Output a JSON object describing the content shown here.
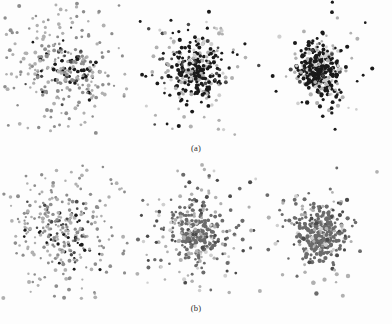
{
  "figure": {
    "background": "#fdfdfd",
    "rows": [
      {
        "id": "a",
        "caption": "(a)"
      },
      {
        "id": "b",
        "caption": "(b)"
      }
    ]
  },
  "colors": {
    "dark": "#1a1a1a",
    "mid_dark": "#4a4a4a",
    "mid": "#6b6b6b",
    "mid_light": "#8d8d8d",
    "light": "#b0b0b0",
    "pale": "#cfcfcf",
    "background": "#fdfdfd"
  },
  "chart_data": {
    "type": "scatter",
    "title": "",
    "xlabel": "",
    "ylabel": "",
    "grid": false,
    "legend": null,
    "axes_visible": false,
    "panel_layout": {
      "rows": 2,
      "cols": 3
    },
    "panels": [
      {
        "row": "a",
        "col": 1,
        "name": "panel-a-1",
        "center": [
          65,
          70
        ],
        "n_points": 330,
        "spread_x": 30,
        "spread_y": 33,
        "core_concentration": 0.3,
        "dot_radius": [
          1.1,
          2.0
        ],
        "color_mix": [
          {
            "color": "#1a1a1a",
            "weight": 0.34
          },
          {
            "color": "#4a4a4a",
            "weight": 0.2
          },
          {
            "color": "#8d8d8d",
            "weight": 0.24
          },
          {
            "color": "#b0b0b0",
            "weight": 0.22
          }
        ],
        "seed": 11
      },
      {
        "row": "a",
        "col": 2,
        "name": "panel-a-2",
        "center": [
          196,
          70
        ],
        "n_points": 350,
        "spread_x": 25,
        "spread_y": 28,
        "core_concentration": 0.62,
        "dot_radius": [
          1.2,
          2.1
        ],
        "color_mix": [
          {
            "color": "#1a1a1a",
            "weight": 0.7
          },
          {
            "color": "#4a4a4a",
            "weight": 0.06
          },
          {
            "color": "#b0b0b0",
            "weight": 0.17
          },
          {
            "color": "#cfcfcf",
            "weight": 0.07
          }
        ],
        "seed": 23
      },
      {
        "row": "a",
        "col": 3,
        "name": "panel-a-3",
        "center": [
          320,
          70
        ],
        "n_points": 350,
        "spread_x": 20,
        "spread_y": 24,
        "core_concentration": 0.78,
        "dot_radius": [
          1.2,
          2.2
        ],
        "color_mix": [
          {
            "color": "#1a1a1a",
            "weight": 0.74
          },
          {
            "color": "#4a4a4a",
            "weight": 0.04
          },
          {
            "color": "#b0b0b0",
            "weight": 0.16
          },
          {
            "color": "#cfcfcf",
            "weight": 0.06
          }
        ],
        "seed": 37
      },
      {
        "row": "b",
        "col": 1,
        "name": "panel-b-1",
        "center": [
          65,
          70
        ],
        "n_points": 340,
        "spread_x": 30,
        "spread_y": 33,
        "core_concentration": 0.3,
        "dot_radius": [
          1.1,
          2.0
        ],
        "color_mix": [
          {
            "color": "#1a1a1a",
            "weight": 0.3
          },
          {
            "color": "#4a4a4a",
            "weight": 0.22
          },
          {
            "color": "#8d8d8d",
            "weight": 0.26
          },
          {
            "color": "#b0b0b0",
            "weight": 0.22
          }
        ],
        "seed": 53
      },
      {
        "row": "b",
        "col": 2,
        "name": "panel-b-2",
        "center": [
          196,
          70
        ],
        "n_points": 360,
        "spread_x": 26,
        "spread_y": 29,
        "core_concentration": 0.6,
        "dot_radius": [
          1.2,
          2.1
        ],
        "color_mix": [
          {
            "color": "#6b6b6b",
            "weight": 0.68
          },
          {
            "color": "#4a4a4a",
            "weight": 0.08
          },
          {
            "color": "#b0b0b0",
            "weight": 0.17
          },
          {
            "color": "#cfcfcf",
            "weight": 0.07
          }
        ],
        "seed": 67
      },
      {
        "row": "b",
        "col": 3,
        "name": "panel-b-3",
        "center": [
          320,
          70
        ],
        "n_points": 360,
        "spread_x": 22,
        "spread_y": 26,
        "core_concentration": 0.74,
        "dot_radius": [
          1.2,
          2.2
        ],
        "color_mix": [
          {
            "color": "#6b6b6b",
            "weight": 0.7
          },
          {
            "color": "#4a4a4a",
            "weight": 0.07
          },
          {
            "color": "#b0b0b0",
            "weight": 0.16
          },
          {
            "color": "#cfcfcf",
            "weight": 0.07
          }
        ],
        "seed": 83
      }
    ]
  }
}
